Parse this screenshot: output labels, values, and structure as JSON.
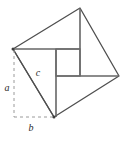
{
  "figure": {
    "canvas": {
      "width": 126,
      "height": 144
    },
    "colors": {
      "stroke": "#5a5a5a",
      "stroke_dark": "#3d3d3d",
      "dashed": "#9a9a9a",
      "label": "#2b2b2b",
      "background": "#ffffff"
    },
    "outer_square": {
      "name": "tilted-square",
      "vertices": [
        {
          "id": "left",
          "x": 13,
          "y": 49
        },
        {
          "id": "top",
          "x": 80,
          "y": 8
        },
        {
          "id": "right",
          "x": 119,
          "y": 76
        },
        {
          "id": "bottom",
          "x": 54,
          "y": 117
        }
      ]
    },
    "inner_square": {
      "name": "center-square",
      "x": 56,
      "y": 49,
      "width": 24,
      "height": 27
    },
    "spokes": [
      {
        "id": "spoke-top-left",
        "x1": 13,
        "y1": 49,
        "x2": 80,
        "y2": 49
      },
      {
        "id": "spoke-top-right",
        "x1": 80,
        "y1": 8,
        "x2": 80,
        "y2": 76
      },
      {
        "id": "spoke-bottom-right",
        "x1": 56,
        "y1": 76,
        "x2": 119,
        "y2": 76
      },
      {
        "id": "spoke-bottom-left",
        "x1": 56,
        "y1": 49,
        "x2": 56,
        "y2": 117
      }
    ],
    "hypotenuse": {
      "id": "leg-c",
      "x1": 13,
      "y1": 49,
      "x2": 54,
      "y2": 117
    },
    "dashed_legs": [
      {
        "id": "leg-a",
        "x1": 14,
        "y1": 50,
        "x2": 14,
        "y2": 117
      },
      {
        "id": "leg-b",
        "x1": 14,
        "y1": 117,
        "x2": 54,
        "y2": 117
      }
    ],
    "labels": [
      {
        "id": "label-a",
        "text": "a",
        "x": 7,
        "y": 91
      },
      {
        "id": "label-b",
        "text": "b",
        "x": 31,
        "y": 131
      },
      {
        "id": "label-c",
        "text": "c",
        "x": 38,
        "y": 76
      }
    ]
  }
}
